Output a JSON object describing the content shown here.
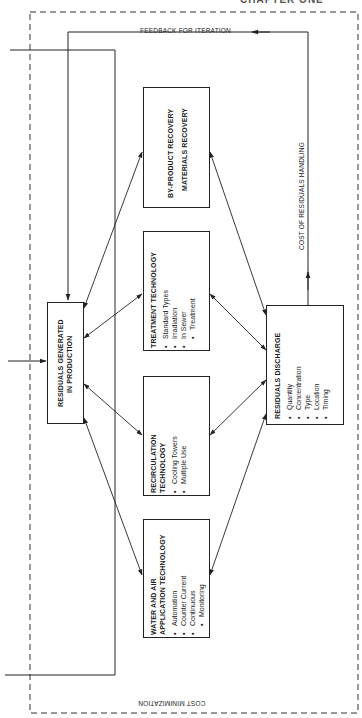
{
  "header": {
    "cut_off_text": "CHAPTER ONE"
  },
  "labels": {
    "feedback": "FEEDBACK FOR ITERATION",
    "cost_handling": "COST OF RESIDUALS HANDLING",
    "cost_minimization": "COST MINIMIZATION"
  },
  "boxes": {
    "residuals_generated": {
      "title_line1": "RESIDUALS GENERATED",
      "title_line2": "IN PRODUCTION"
    },
    "byproduct": {
      "title_line1": "BY-PRODUCT RECOVERY",
      "title_line2": "MATERIALS RECOVERY"
    },
    "treatment": {
      "title": "TREATMENT TECHNOLOGY",
      "items": [
        "Standard Types",
        "Irradiation",
        "In Sewer",
        "Treatment"
      ]
    },
    "recirculation": {
      "title_line1": "RECIRCULATION",
      "title_line2": "TECHNOLOGY",
      "items": [
        "Cooling Towers",
        "Multiple Use"
      ]
    },
    "water_air": {
      "title_line1": "WATER AND AIR",
      "title_line2": "APPLICATION TECHNOLOGY",
      "items": [
        "Automation",
        "Counter Current",
        "Continuous",
        "Monitoring"
      ]
    },
    "residuals_discharge": {
      "title": "RESIDUALS DISCHARGE",
      "items": [
        "Quantity",
        "Concentration",
        "Type",
        "Location",
        "Timing"
      ]
    }
  },
  "colors": {
    "line": "#222222",
    "background": "#ffffff"
  }
}
